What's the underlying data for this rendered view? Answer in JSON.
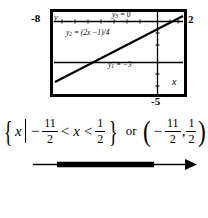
{
  "graph": {
    "window": {
      "xmin_label": "-8",
      "xmax_label": "2",
      "ymin_label": "-5",
      "x_axis_name": "x",
      "y_axis_name": "y"
    },
    "functions": [
      {
        "name": "y1",
        "sub": "1",
        "equation_label": "y₁ = −3",
        "lhs": "y",
        "subscript": "1",
        "rhs": "= −3"
      },
      {
        "name": "y2",
        "sub": "2",
        "equation_label": "y₂ = (2x − 1)/4",
        "lhs": "y",
        "subscript": "2",
        "rhs": "= (2x −1)/4"
      },
      {
        "name": "y3",
        "sub": "3",
        "equation_label": "y₃ = 0",
        "lhs": "y",
        "subscript": "3",
        "rhs": "= 0"
      }
    ],
    "colors": {
      "ink": "#000000",
      "background": "#ffffff",
      "border": "#000000"
    }
  },
  "solution": {
    "set_builder": {
      "open_brace": "{",
      "variable": "x",
      "such_that": "|",
      "lower_sign": "−",
      "lower_num": "11",
      "lower_den": "2",
      "rel1": "<",
      "inner_variable": "x",
      "rel2": "<",
      "upper_num": "1",
      "upper_den": "2",
      "close_brace": "}"
    },
    "conjunction": "or",
    "interval": {
      "open_paren": "(",
      "left_sign": "−",
      "left_num": "11",
      "left_den": "2",
      "separator": ",",
      "right_num": "1",
      "right_den": "2",
      "close_paren": ")"
    }
  },
  "number_line": {
    "left_endpoint_marker": "(",
    "right_endpoint_marker": ")",
    "left_label": {
      "sign": "−",
      "num": "11",
      "den": "2"
    },
    "right_label": {
      "sign": "",
      "num": "1",
      "den": "2"
    },
    "arrow_direction": "right",
    "interval_type": "open"
  }
}
